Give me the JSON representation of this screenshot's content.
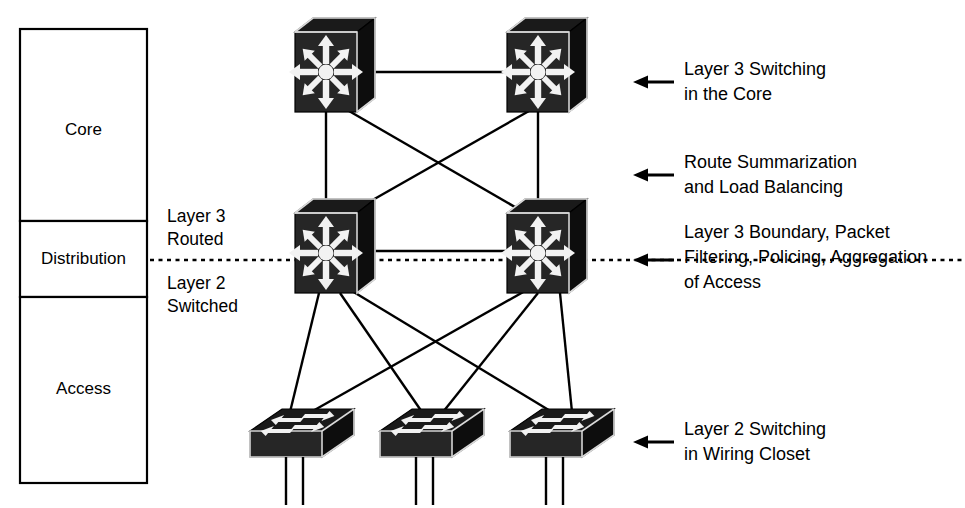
{
  "layer_column": {
    "name": "layer-column",
    "boxes": [
      {
        "id": "core",
        "label": "Core",
        "x": 20,
        "y": 29,
        "w": 127,
        "h": 192
      },
      {
        "id": "distribution",
        "label": "Distribution",
        "x": 20,
        "y": 221,
        "w": 127,
        "h": 76
      },
      {
        "id": "access",
        "label": "Access",
        "x": 20,
        "y": 297,
        "w": 127,
        "h": 186
      }
    ]
  },
  "boundary": {
    "upper_label_line1": "Layer 3",
    "upper_label_line2": "Routed",
    "lower_label_line1": "Layer 2",
    "lower_label_line2": "Switched",
    "dashed_line": {
      "y": 260,
      "x1": 150,
      "x2": 965
    }
  },
  "annotations": [
    {
      "id": "core-note",
      "arrow_y": 82,
      "arrow_x1": 672,
      "arrow_x2": 634,
      "text_x": 682,
      "lines": [
        "Layer 3 Switching",
        "in the Core"
      ],
      "line_y": [
        75,
        100
      ]
    },
    {
      "id": "summarization-note",
      "arrow_y": 175,
      "arrow_x1": 672,
      "arrow_x2": 634,
      "text_x": 682,
      "lines": [
        "Route Summarization",
        "and Load Balancing"
      ],
      "line_y": [
        168,
        193
      ]
    },
    {
      "id": "distribution-note",
      "arrow_y": 260,
      "arrow_x1": 672,
      "arrow_x2": 634,
      "text_x": 682,
      "lines": [
        "Layer 3 Boundary, Packet",
        "Filtering, Policing, Aggregation",
        "of Access"
      ],
      "line_y": [
        238,
        263,
        288
      ]
    },
    {
      "id": "access-note",
      "arrow_y": 442,
      "arrow_x1": 672,
      "arrow_x2": 634,
      "text_x": 682,
      "lines": [
        "Layer 2 Switching",
        "in Wiring Closet"
      ],
      "line_y": [
        435,
        460
      ]
    }
  ],
  "nodes": {
    "core": [
      {
        "id": "core-switch-1",
        "name": "core-switch-left",
        "cx": 333,
        "cy": 72
      },
      {
        "id": "core-switch-2",
        "name": "core-switch-right",
        "cx": 545,
        "cy": 72
      }
    ],
    "distribution": [
      {
        "id": "dist-switch-1",
        "name": "distribution-switch-left",
        "cx": 333,
        "cy": 253
      },
      {
        "id": "dist-switch-2",
        "name": "distribution-switch-right",
        "cx": 545,
        "cy": 253
      }
    ],
    "access": [
      {
        "id": "access-switch-1",
        "name": "access-switch-1",
        "cx": 302,
        "cy": 435
      },
      {
        "id": "access-switch-2",
        "name": "access-switch-2",
        "cx": 432,
        "cy": 435
      },
      {
        "id": "access-switch-3",
        "name": "access-switch-3",
        "cx": 562,
        "cy": 435
      }
    ]
  },
  "links": {
    "core_to_core": [
      {
        "from": "core-switch-1",
        "to": "core-switch-2"
      }
    ],
    "distribution_to_distribution": [
      {
        "from": "dist-switch-1",
        "to": "dist-switch-2"
      }
    ],
    "core_to_distribution": [
      {
        "from": "core-switch-1",
        "to": "dist-switch-1"
      },
      {
        "from": "core-switch-2",
        "to": "dist-switch-2"
      },
      {
        "from": "core-switch-1",
        "to": "dist-switch-2"
      },
      {
        "from": "core-switch-2",
        "to": "dist-switch-1"
      }
    ],
    "distribution_to_access": [
      {
        "from": "dist-switch-1",
        "to": "access-switch-1"
      },
      {
        "from": "dist-switch-1",
        "to": "access-switch-2"
      },
      {
        "from": "dist-switch-1",
        "to": "access-switch-3"
      },
      {
        "from": "dist-switch-2",
        "to": "access-switch-1"
      },
      {
        "from": "dist-switch-2",
        "to": "access-switch-2"
      },
      {
        "from": "dist-switch-2",
        "to": "access-switch-3"
      }
    ]
  },
  "colors": {
    "background": "#ffffff",
    "line": "#000000",
    "device_body": "#1a1a1a",
    "device_glyph": "#f2f2f2",
    "text": "#000000"
  },
  "icon_names": {
    "layer3_switch": "layer3-switch-icon",
    "workgroup_switch": "workgroup-switch-icon",
    "callout_arrow": "left-arrow-icon"
  }
}
